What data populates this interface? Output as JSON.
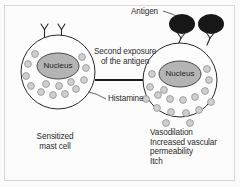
{
  "figure": {
    "type": "biology-diagram",
    "background_color": "#fcfcfc",
    "frame_color": "#d8d8d8"
  },
  "labels": {
    "antigen": "Antigen",
    "second_exposure_line1": "Second exposure",
    "second_exposure_line2": "of the antigen",
    "histamine": "Histamine",
    "sensitized_line1": "Sensitized",
    "sensitized_line2": "mast cell",
    "nucleus_left": "Nucleus",
    "nucleus_right": "Nucleus",
    "effects_line1": "Vasodilation",
    "effects_line2": "Increased vascular",
    "effects_line3": "permeability",
    "effects_line4": "Itch"
  },
  "colors": {
    "cell_outline": "#2a2a2a",
    "nucleus_fill": "#b4b4b4",
    "nucleus_outline": "#4a4a4a",
    "granule_fill": "#cfcfcf",
    "granule_outline": "#9a9a9a",
    "antigen_fill": "#171717",
    "text": "#2b2b2b",
    "arrow": "#1a1a1a"
  },
  "left_cell": {
    "name": "sensitized-mast-cell",
    "center_x": 58,
    "center_y": 72,
    "radius": 37,
    "receptor_count": 2,
    "granule_count": 14,
    "granules_outside": 0
  },
  "right_cell": {
    "name": "degranulating-mast-cell",
    "center_x": 180,
    "center_y": 80,
    "radius": 37,
    "receptor_count": 2,
    "granule_count": 18,
    "granules_outside": 8,
    "antigen_count": 2
  },
  "arrow": {
    "name": "second-exposure-arrow",
    "x1": 95,
    "y1": 80,
    "x2": 151,
    "y2": 80
  }
}
